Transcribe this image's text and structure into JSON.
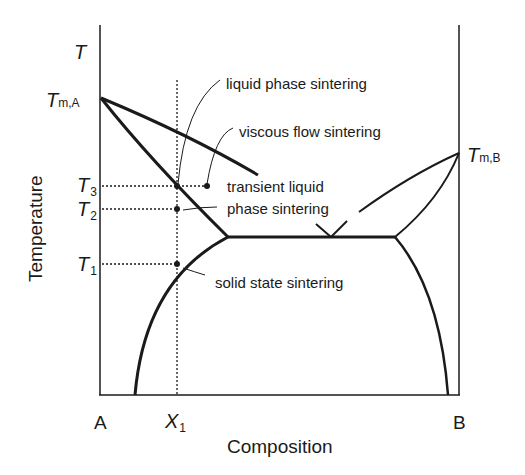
{
  "diagram": {
    "type": "binary phase diagram",
    "axes": {
      "y_symbol": "T",
      "y_label": "Temperature",
      "x_label": "Composition",
      "x_left": "A",
      "x_right": "B",
      "x_marker": "X",
      "x_marker_sub": "1"
    },
    "temperatures": {
      "tm_a": {
        "sym": "T",
        "sub": "m,A"
      },
      "tm_b": {
        "sym": "T",
        "sub": "m,B"
      },
      "t3": {
        "sym": "T",
        "sub": "3"
      },
      "t2": {
        "sym": "T",
        "sub": "2"
      },
      "t1": {
        "sym": "T",
        "sub": "1"
      }
    },
    "annotations": {
      "liquid_phase": "liquid phase sintering",
      "viscous_flow": "viscous flow sintering",
      "transient_line1": "transient liquid",
      "transient_line2": "phase sintering",
      "solid_state": "solid state sintering"
    },
    "colors": {
      "line": "#1a1a1a",
      "background": "#ffffff"
    }
  }
}
